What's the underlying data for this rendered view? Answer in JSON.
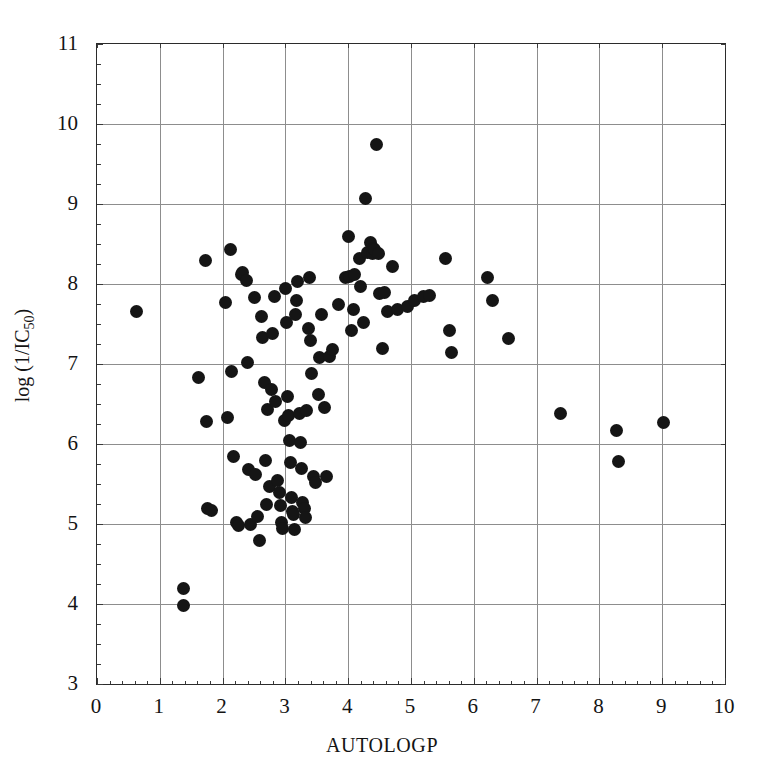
{
  "chart_data": {
    "type": "scatter",
    "title": "",
    "xlabel": "AUTOLOGP",
    "ylabel": "log (1/IC50)",
    "ylabel_base": "log (1/IC",
    "ylabel_sub": "50",
    "ylabel_close": ")",
    "xlim": [
      0,
      10
    ],
    "ylim": [
      3,
      11
    ],
    "xticks": [
      0,
      1,
      2,
      3,
      4,
      5,
      6,
      7,
      8,
      9,
      10
    ],
    "yticks": [
      3,
      4,
      5,
      6,
      7,
      8,
      9,
      10,
      11
    ],
    "xtick_labels": [
      "0",
      "1",
      "2",
      "3",
      "4",
      "5",
      "6",
      "7",
      "8",
      "9",
      "10"
    ],
    "ytick_labels": [
      "3",
      "4",
      "5",
      "6",
      "7",
      "8",
      "9",
      "10",
      "11"
    ],
    "x_minor_step": 0.2,
    "y_minor_step": 0.25,
    "grid": true,
    "legend": false,
    "marker": "filled-circle",
    "marker_color": "#151515",
    "marker_size_px": 13,
    "grid_color": "#8d8d8d",
    "frame_color": "#2b2b2b",
    "background": "#ffffff",
    "n_points": 112,
    "points": [
      [
        0.63,
        7.66
      ],
      [
        1.37,
        4.2
      ],
      [
        1.38,
        3.98
      ],
      [
        1.62,
        6.83
      ],
      [
        1.72,
        8.29
      ],
      [
        1.74,
        6.28
      ],
      [
        1.76,
        5.19
      ],
      [
        1.82,
        5.17
      ],
      [
        2.05,
        7.77
      ],
      [
        2.08,
        6.33
      ],
      [
        2.12,
        8.43
      ],
      [
        2.14,
        6.91
      ],
      [
        2.18,
        5.85
      ],
      [
        2.22,
        5.02
      ],
      [
        2.26,
        4.98
      ],
      [
        2.3,
        8.12
      ],
      [
        2.32,
        8.15
      ],
      [
        2.38,
        8.05
      ],
      [
        2.4,
        7.02
      ],
      [
        2.42,
        5.68
      ],
      [
        2.44,
        5.0
      ],
      [
        2.5,
        7.83
      ],
      [
        2.52,
        5.62
      ],
      [
        2.55,
        5.09
      ],
      [
        2.58,
        4.8
      ],
      [
        2.62,
        7.59
      ],
      [
        2.64,
        7.33
      ],
      [
        2.66,
        6.77
      ],
      [
        2.68,
        5.8
      ],
      [
        2.7,
        5.24
      ],
      [
        2.72,
        6.43
      ],
      [
        2.75,
        5.47
      ],
      [
        2.78,
        6.68
      ],
      [
        2.8,
        7.38
      ],
      [
        2.82,
        7.84
      ],
      [
        2.85,
        6.53
      ],
      [
        2.88,
        5.55
      ],
      [
        2.9,
        5.4
      ],
      [
        2.92,
        5.23
      ],
      [
        2.94,
        5.02
      ],
      [
        2.96,
        4.95
      ],
      [
        2.98,
        6.3
      ],
      [
        3.0,
        7.95
      ],
      [
        3.02,
        7.52
      ],
      [
        3.03,
        6.6
      ],
      [
        3.05,
        6.36
      ],
      [
        3.06,
        6.05
      ],
      [
        3.08,
        5.77
      ],
      [
        3.1,
        5.33
      ],
      [
        3.12,
        5.16
      ],
      [
        3.13,
        5.12
      ],
      [
        3.15,
        4.93
      ],
      [
        3.16,
        7.62
      ],
      [
        3.18,
        7.8
      ],
      [
        3.2,
        8.03
      ],
      [
        3.22,
        6.38
      ],
      [
        3.24,
        6.02
      ],
      [
        3.26,
        5.7
      ],
      [
        3.28,
        5.27
      ],
      [
        3.3,
        5.19
      ],
      [
        3.32,
        5.08
      ],
      [
        3.34,
        6.42
      ],
      [
        3.36,
        7.45
      ],
      [
        3.38,
        8.08
      ],
      [
        3.4,
        7.3
      ],
      [
        3.42,
        6.88
      ],
      [
        3.45,
        5.59
      ],
      [
        3.48,
        5.52
      ],
      [
        3.52,
        6.62
      ],
      [
        3.55,
        7.08
      ],
      [
        3.58,
        7.62
      ],
      [
        3.62,
        6.46
      ],
      [
        3.65,
        5.6
      ],
      [
        3.7,
        7.1
      ],
      [
        3.75,
        7.18
      ],
      [
        3.85,
        7.75
      ],
      [
        3.95,
        8.08
      ],
      [
        4.0,
        8.6
      ],
      [
        4.02,
        8.1
      ],
      [
        4.05,
        7.42
      ],
      [
        4.08,
        7.68
      ],
      [
        4.1,
        8.12
      ],
      [
        4.18,
        8.32
      ],
      [
        4.2,
        7.97
      ],
      [
        4.25,
        7.52
      ],
      [
        4.28,
        9.07
      ],
      [
        4.3,
        8.4
      ],
      [
        4.35,
        8.52
      ],
      [
        4.38,
        8.38
      ],
      [
        4.4,
        8.45
      ],
      [
        4.42,
        8.43
      ],
      [
        4.45,
        9.75
      ],
      [
        4.48,
        8.38
      ],
      [
        4.5,
        7.88
      ],
      [
        4.55,
        7.2
      ],
      [
        4.58,
        7.9
      ],
      [
        4.62,
        7.66
      ],
      [
        4.7,
        8.22
      ],
      [
        4.78,
        7.68
      ],
      [
        4.95,
        7.72
      ],
      [
        5.05,
        7.8
      ],
      [
        5.2,
        7.85
      ],
      [
        5.3,
        7.86
      ],
      [
        5.55,
        8.32
      ],
      [
        5.62,
        7.42
      ],
      [
        5.65,
        7.14
      ],
      [
        6.22,
        8.08
      ],
      [
        6.3,
        7.8
      ],
      [
        6.55,
        7.32
      ],
      [
        7.38,
        6.38
      ],
      [
        8.28,
        6.17
      ],
      [
        8.3,
        5.78
      ],
      [
        9.02,
        6.27
      ]
    ]
  }
}
